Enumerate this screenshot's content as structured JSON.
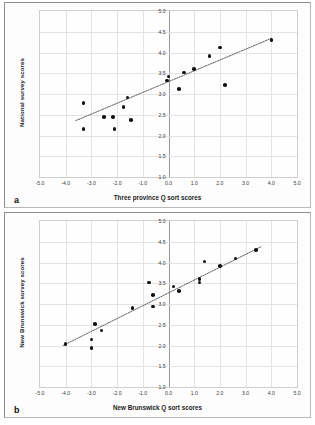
{
  "figure": {
    "panels": [
      {
        "letter": "a",
        "xlabel": "Three province Q sort scores",
        "ylabel": "National survey scores"
      },
      {
        "letter": "b",
        "xlabel": "New Brunswick Q sort scores",
        "ylabel": "New Brunswick survey scores"
      }
    ]
  },
  "chart_data": [
    {
      "type": "scatter",
      "title": "",
      "panel": "a",
      "xlabel": "Three province Q sort scores",
      "ylabel": "National survey scores",
      "xlim": [
        -5.0,
        5.0
      ],
      "ylim": [
        1.0,
        5.0
      ],
      "xticks": [
        "-5.0",
        "-4.0",
        "-3.0",
        "-2.0",
        "-1.0",
        "0.0",
        "1.0",
        "2.0",
        "3.0",
        "4.0",
        "5.0"
      ],
      "yticks": [
        "1.0",
        "1.5",
        "2.0",
        "2.5",
        "3.0",
        "3.5",
        "4.0",
        "4.5",
        "5.0"
      ],
      "xtick_values": [
        -5,
        -4,
        -3,
        -2,
        -1,
        0,
        1,
        2,
        3,
        4,
        5
      ],
      "ytick_values": [
        1.0,
        1.5,
        2.0,
        2.5,
        3.0,
        3.5,
        4.0,
        4.5,
        5.0
      ],
      "grid": true,
      "legend": "none",
      "points": [
        {
          "x": -3.3,
          "y": 2.15
        },
        {
          "x": -3.3,
          "y": 2.78
        },
        {
          "x": -2.5,
          "y": 2.45
        },
        {
          "x": -2.15,
          "y": 2.45
        },
        {
          "x": -2.1,
          "y": 2.15
        },
        {
          "x": -1.75,
          "y": 2.69
        },
        {
          "x": -1.6,
          "y": 2.92
        },
        {
          "x": -1.45,
          "y": 2.37
        },
        {
          "x": -0.05,
          "y": 3.33
        },
        {
          "x": 0.0,
          "y": 3.42
        },
        {
          "x": 0.4,
          "y": 3.12
        },
        {
          "x": 0.6,
          "y": 3.52
        },
        {
          "x": 1.0,
          "y": 3.6
        },
        {
          "x": 1.6,
          "y": 3.92
        },
        {
          "x": 2.0,
          "y": 4.12
        },
        {
          "x": 2.2,
          "y": 3.22
        },
        {
          "x": 4.0,
          "y": 4.3
        }
      ],
      "trendline": {
        "x1": -3.6,
        "y1": 2.36,
        "x2": 4.0,
        "y2": 4.34,
        "style": "dotted"
      }
    },
    {
      "type": "scatter",
      "title": "",
      "panel": "b",
      "xlabel": "New Brunswick Q sort scores",
      "ylabel": "New Brunswick survey scores",
      "xlim": [
        -5.0,
        5.0
      ],
      "ylim": [
        1.0,
        5.0
      ],
      "xticks": [
        "-5.0",
        "-4.0",
        "-3.0",
        "-2.0",
        "-1.0",
        "0.0",
        "1.0",
        "2.0",
        "3.0",
        "4.0",
        "5.0"
      ],
      "yticks": [
        "1.0",
        "1.5",
        "2.0",
        "2.5",
        "3.0",
        "3.5",
        "4.0",
        "4.5",
        "5.0"
      ],
      "xtick_values": [
        -5,
        -4,
        -3,
        -2,
        -1,
        0,
        1,
        2,
        3,
        4,
        5
      ],
      "ytick_values": [
        1.0,
        1.5,
        2.0,
        2.5,
        3.0,
        3.5,
        4.0,
        4.5,
        5.0
      ],
      "grid": true,
      "legend": "none",
      "points": [
        {
          "x": -4.0,
          "y": 2.04
        },
        {
          "x": -3.0,
          "y": 1.94
        },
        {
          "x": -3.0,
          "y": 2.14
        },
        {
          "x": -2.85,
          "y": 2.52
        },
        {
          "x": -2.6,
          "y": 2.36
        },
        {
          "x": -1.4,
          "y": 2.9
        },
        {
          "x": -0.75,
          "y": 3.52
        },
        {
          "x": -0.6,
          "y": 3.22
        },
        {
          "x": -0.6,
          "y": 2.94
        },
        {
          "x": 0.2,
          "y": 3.42
        },
        {
          "x": 0.4,
          "y": 3.32
        },
        {
          "x": 1.2,
          "y": 3.6
        },
        {
          "x": 1.2,
          "y": 3.52
        },
        {
          "x": 1.4,
          "y": 4.02
        },
        {
          "x": 2.0,
          "y": 3.92
        },
        {
          "x": 2.6,
          "y": 4.1
        },
        {
          "x": 3.4,
          "y": 4.3
        }
      ],
      "trendline": {
        "x1": -4.1,
        "y1": 2.0,
        "x2": 3.6,
        "y2": 4.38,
        "style": "dotted"
      }
    }
  ]
}
